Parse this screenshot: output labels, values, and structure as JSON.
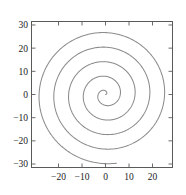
{
  "chart_data": {
    "type": "line",
    "title": "",
    "xlabel": "",
    "ylabel": "",
    "xlim": [
      -31.5,
      28.5
    ],
    "ylim": [
      -31.5,
      31.5
    ],
    "xticks": [
      -20,
      -10,
      0,
      10,
      20
    ],
    "xtick_labels": [
      "-20",
      "-10",
      "0",
      "10",
      "20"
    ],
    "yticks": [
      -30,
      -20,
      -10,
      0,
      10,
      20,
      30
    ],
    "ytick_labels": [
      "-30",
      "-20",
      "-10",
      "0",
      "10",
      "20",
      "30"
    ],
    "grid": false,
    "legend": null,
    "series": [
      {
        "name": "archimedean-spiral",
        "description": "r = theta, polar spiral from theta = 0 to theta = 30 radians",
        "equation_r": "r = theta",
        "theta_start": 0,
        "theta_end": 30,
        "turns": 4.77,
        "turn_spacing": 6.28,
        "max_radius": 30,
        "color": "#8c8c8c",
        "linewidth": 1.05,
        "center": [
          0,
          0
        ],
        "radial_crossings_positive_y": [
          6.3,
          12.6,
          18.8,
          25.1,
          30.0
        ],
        "radial_crossings_negative_y": [
          3.1,
          9.4,
          15.7,
          22.0,
          28.3
        ],
        "radial_crossings_positive_x": [
          1.6,
          7.9,
          14.1,
          20.4,
          26.7
        ],
        "radial_crossings_negative_x": [
          4.7,
          11.0,
          17.3,
          23.6,
          29.8
        ]
      }
    ]
  },
  "axes": {
    "frame_color": "#5a5a5a",
    "background": "#ffffff",
    "tick_direction": "out"
  }
}
